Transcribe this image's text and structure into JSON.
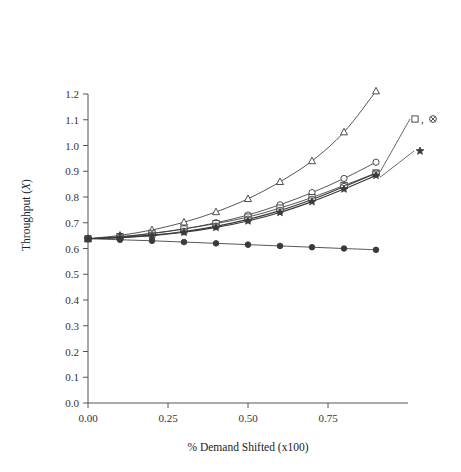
{
  "chart_data": {
    "type": "line",
    "title": "",
    "xlabel": "% Demand Shifted (x100)",
    "ylabel": "Throughput (X)",
    "xlim": [
      0.0,
      1.0
    ],
    "ylim": [
      0.0,
      1.25
    ],
    "xticks": [
      "0.00",
      "0.25",
      "0.50",
      "0.75"
    ],
    "xtick_values": [
      0.0,
      0.25,
      0.5,
      0.75
    ],
    "yticks": [
      "0.0",
      "0.1",
      "0.2",
      "0.3",
      "0.4",
      "0.5",
      "0.6",
      "0.7",
      "0.8",
      "0.9",
      "1.0",
      "1.1",
      "1.2"
    ],
    "ytick_values": [
      0.0,
      0.1,
      0.2,
      0.3,
      0.4,
      0.5,
      0.6,
      0.7,
      0.8,
      0.9,
      1.0,
      1.1,
      1.2
    ],
    "grid": false,
    "legend_position": "right-annotations",
    "x": [
      0.0,
      0.1,
      0.2,
      0.3,
      0.4,
      0.5,
      0.6,
      0.7,
      0.8,
      0.9
    ],
    "series": [
      {
        "name": "triangle-series",
        "marker": "triangle-up-open",
        "values": [
          0.638,
          0.651,
          0.672,
          0.702,
          0.742,
          0.793,
          0.859,
          0.94,
          1.052,
          1.211
        ]
      },
      {
        "name": "circle-series",
        "marker": "circle-open",
        "values": [
          0.638,
          0.645,
          0.658,
          0.676,
          0.7,
          0.73,
          0.77,
          0.817,
          0.872,
          0.935
        ]
      },
      {
        "name": "square-series",
        "marker": "square-open",
        "values": [
          0.638,
          0.646,
          0.659,
          0.676,
          0.697,
          0.722,
          0.757,
          0.798,
          0.845,
          0.893
        ]
      },
      {
        "name": "circled-x-series",
        "marker": "circled-x",
        "values": [
          0.638,
          0.643,
          0.652,
          0.666,
          0.686,
          0.713,
          0.747,
          0.79,
          0.84,
          0.892
        ]
      },
      {
        "name": "star-series",
        "marker": "star",
        "values": [
          0.638,
          0.642,
          0.65,
          0.663,
          0.682,
          0.707,
          0.74,
          0.782,
          0.831,
          0.884
        ]
      },
      {
        "name": "filled-circle-series",
        "marker": "circle-filled",
        "values": [
          0.638,
          0.634,
          0.63,
          0.625,
          0.62,
          0.615,
          0.61,
          0.605,
          0.6,
          0.595
        ]
      }
    ],
    "annotations": [
      {
        "name": "legend-square-circledx",
        "label": "□, ⊗",
        "markers": [
          "square-open",
          "circled-x"
        ],
        "points_to": "cluster-endpoint"
      },
      {
        "name": "legend-star",
        "label": "★",
        "markers": [
          "star"
        ],
        "points_to": "star-endpoint"
      }
    ]
  },
  "legend": {
    "entry_square_circledx": "□, ⊗",
    "entry_star": "★"
  },
  "colors": {
    "line": "#3a3a3a",
    "axis": "#555555",
    "text": "#222222",
    "background": "#ffffff"
  }
}
